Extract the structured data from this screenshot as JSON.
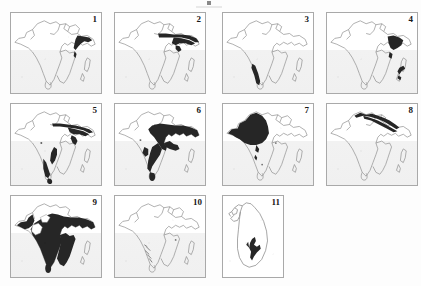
{
  "figure": {
    "title": "",
    "panel_count": 11,
    "rows": 3,
    "columns": 4,
    "outline_color": "#8d8d8d",
    "shade_color": "#262626",
    "background_color": "#fdfdfd",
    "sea_color": "#f0f0f0",
    "border_color": "#a9a9a9",
    "number_color": "#171717",
    "top_artifact": "partial-cut-off-mark"
  },
  "panels": [
    {
      "number": "1",
      "base_map": "south-asia",
      "shaded_region": "north-east India and Bangladesh delta",
      "shade_extent": "small"
    },
    {
      "number": "2",
      "base_map": "south-asia",
      "shaded_region": "eastern Himalayan foothills band and north-east",
      "shade_extent": "narrow band"
    },
    {
      "number": "3",
      "base_map": "south-asia",
      "shaded_region": "south-west coast Western Ghats strip",
      "shade_extent": "narrow strip"
    },
    {
      "number": "4",
      "base_map": "south-asia",
      "shaded_region": "north-east India and small south-east coastal mark",
      "shade_extent": "small"
    },
    {
      "number": "5",
      "base_map": "south-asia",
      "shaded_region": "Himalayan belt, eastern coast and Western Ghats to southern tip",
      "shade_extent": "medium"
    },
    {
      "number": "6",
      "base_map": "south-asia",
      "shaded_region": "central and eastern India extending south-west to the Ghats",
      "shade_extent": "large"
    },
    {
      "number": "7",
      "base_map": "south-asia",
      "shaded_region": "north-west arid zone: Pakistan and Rajasthan",
      "shade_extent": "large"
    },
    {
      "number": "8",
      "base_map": "south-asia",
      "shaded_region": "Himalayan arc",
      "shade_extent": "narrow arc"
    },
    {
      "number": "9",
      "base_map": "south-asia",
      "shaded_region": "most of peninsular India and the north-east",
      "shade_extent": "very large"
    },
    {
      "number": "10",
      "base_map": "south-asia",
      "shaded_region": "scattered faint patches in central-southern India",
      "shade_extent": "scattered"
    },
    {
      "number": "11",
      "base_map": "sri-lanka",
      "shaded_region": "central-southern wet zone of Sri Lanka",
      "shade_extent": "small"
    }
  ]
}
